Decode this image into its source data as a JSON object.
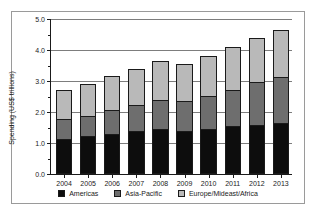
{
  "chart_data": {
    "type": "bar",
    "subtype": "stacked-vertical",
    "title": "",
    "xlabel": "",
    "ylabel": "Spending (US$ trillions)",
    "categories": [
      "2004",
      "2005",
      "2006",
      "2007",
      "2008",
      "2009",
      "2010",
      "2011",
      "2012",
      "2013"
    ],
    "series": [
      {
        "name": "Americas",
        "color": "#0d0d0d",
        "values": [
          1.1,
          1.2,
          1.25,
          1.35,
          1.4,
          1.35,
          1.4,
          1.5,
          1.55,
          1.6
        ]
      },
      {
        "name": "Asia-Pacific",
        "color": "#6e6e6e",
        "values": [
          0.65,
          0.65,
          0.8,
          0.85,
          0.95,
          1.0,
          1.1,
          1.2,
          1.4,
          1.5
        ]
      },
      {
        "name": "Europe/Mideast/Africa",
        "color": "#b9b9b9",
        "values": [
          0.95,
          1.05,
          1.1,
          1.2,
          1.3,
          1.2,
          1.3,
          1.4,
          1.45,
          1.55
        ]
      }
    ],
    "totals": [
      2.7,
      2.9,
      3.15,
      3.4,
      3.65,
      3.55,
      3.8,
      4.1,
      4.4,
      4.65
    ],
    "ylim": [
      0.0,
      5.0
    ],
    "ytick_labels": [
      "0.0",
      "1.0",
      "2.0",
      "3.0",
      "4.0",
      "5.0"
    ],
    "ytick_values": [
      0.0,
      1.0,
      2.0,
      3.0,
      4.0,
      5.0
    ],
    "yminor_values": [
      0.5,
      1.5,
      2.5,
      3.5,
      4.5
    ],
    "grid": "horizontal",
    "legend_position": "bottom"
  }
}
